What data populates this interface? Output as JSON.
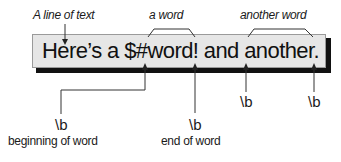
{
  "diagram": {
    "sample_text": "Here’s a $#word! and another.",
    "top_labels": {
      "line_of_text": "A line of text",
      "a_word": "a word",
      "another_word": "another word"
    },
    "boundaries": [
      {
        "token": "\\b",
        "caption": "beginning of word"
      },
      {
        "token": "\\b",
        "caption": "end of word"
      },
      {
        "token": "\\b",
        "caption": ""
      },
      {
        "token": "\\b",
        "caption": ""
      }
    ],
    "colors": {
      "box_fill": "#e6e6e6",
      "box_border": "#9a9a9a",
      "shadow": "#111111",
      "lines": "#333333",
      "text": "#1a1a1a"
    }
  }
}
